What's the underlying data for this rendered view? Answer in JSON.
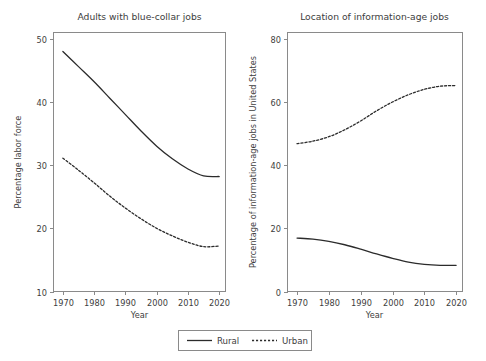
{
  "figure": {
    "width": 486,
    "height": 361,
    "background": "#ffffff",
    "line_color": "#2b2b2b",
    "axis_color": "#8a8a8a",
    "text_color": "#3d3d3d"
  },
  "legend": {
    "position": "bottom-center",
    "entries": [
      {
        "label": "Rural",
        "style": "solid"
      },
      {
        "label": "Urban",
        "style": "dashed"
      }
    ]
  },
  "chart_data": [
    {
      "type": "line",
      "title": "Adults with blue-collar jobs",
      "xlabel": "Year",
      "ylabel": "Percentage labor force",
      "xlim": [
        1967,
        2022
      ],
      "ylim": [
        10,
        51
      ],
      "xticks": [
        1970,
        1980,
        1990,
        2000,
        2010,
        2020
      ],
      "xtick_labels": [
        "1970",
        "1980",
        "1990",
        "2000",
        "2010",
        "2020"
      ],
      "yticks": [
        10,
        20,
        30,
        40,
        50
      ],
      "ytick_labels": [
        "10",
        "20",
        "30",
        "40",
        "50"
      ],
      "grid": false,
      "x": [
        1970,
        1975,
        1980,
        1985,
        1990,
        1995,
        2000,
        2005,
        2010,
        2015,
        2020
      ],
      "series": [
        {
          "name": "Rural",
          "style": "solid",
          "values": [
            48.0,
            45.6,
            43.2,
            40.6,
            38.0,
            35.4,
            33.0,
            31.0,
            29.4,
            28.3,
            28.2
          ]
        },
        {
          "name": "Urban",
          "style": "dashed",
          "values": [
            31.1,
            29.2,
            27.2,
            25.1,
            23.2,
            21.5,
            20.0,
            18.8,
            17.8,
            17.1,
            17.2
          ]
        }
      ]
    },
    {
      "type": "line",
      "title": "Location of information-age jobs",
      "xlabel": "Year",
      "ylabel": "Percentage of information-age jobs in United States",
      "xlim": [
        1967,
        2022
      ],
      "ylim": [
        0,
        82
      ],
      "xticks": [
        1970,
        1980,
        1990,
        2000,
        2010,
        2020
      ],
      "xtick_labels": [
        "1970",
        "1980",
        "1990",
        "2000",
        "2010",
        "2020"
      ],
      "yticks": [
        0,
        20,
        40,
        60,
        80
      ],
      "ytick_labels": [
        "0",
        "20",
        "40",
        "60",
        "80"
      ],
      "grid": false,
      "x": [
        1970,
        1975,
        1980,
        1985,
        1990,
        1995,
        2000,
        2005,
        2010,
        2015,
        2020
      ],
      "series": [
        {
          "name": "Rural",
          "style": "solid",
          "values": [
            16.9,
            16.6,
            15.9,
            14.8,
            13.4,
            11.9,
            10.5,
            9.3,
            8.6,
            8.3,
            8.3
          ]
        },
        {
          "name": "Urban",
          "style": "dashed",
          "values": [
            46.8,
            47.6,
            49.0,
            51.2,
            54.0,
            57.2,
            60.0,
            62.3,
            64.0,
            65.0,
            65.2
          ]
        }
      ]
    }
  ]
}
